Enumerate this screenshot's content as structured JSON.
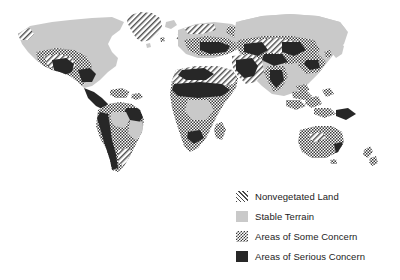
{
  "figure": {
    "kind": "thematic-world-map",
    "background_color": "#ffffff",
    "title": ""
  },
  "map": {
    "projection_hint": "equirectangular",
    "ocean_color": "#ffffff",
    "regions_described": [
      "North America",
      "Greenland",
      "Central America",
      "Caribbean",
      "South America",
      "Europe",
      "Scandinavia",
      "Africa",
      "Madagascar",
      "Middle East",
      "Russia",
      "Central Asia",
      "India",
      "China",
      "Southeast Asia",
      "Indonesia",
      "Japan",
      "Australia",
      "New Zealand"
    ]
  },
  "legend": {
    "position": "bottom-right",
    "items": [
      {
        "label": "Nonvegetated Land",
        "pattern": "diagonal-hatch",
        "swatch_class": "sw-hatch",
        "color": "#4a4a4a"
      },
      {
        "label": "Stable Terrain",
        "pattern": "solid-light-gray",
        "swatch_class": "sw-solid-light",
        "color": "#c9c9c9"
      },
      {
        "label": "Areas of Some Concern",
        "pattern": "checkerboard",
        "swatch_class": "sw-checker",
        "color": "#3a3a3a"
      },
      {
        "label": "Areas of Serious Concern",
        "pattern": "solid-dark",
        "swatch_class": "sw-solid-dark",
        "color": "#272727"
      }
    ]
  }
}
